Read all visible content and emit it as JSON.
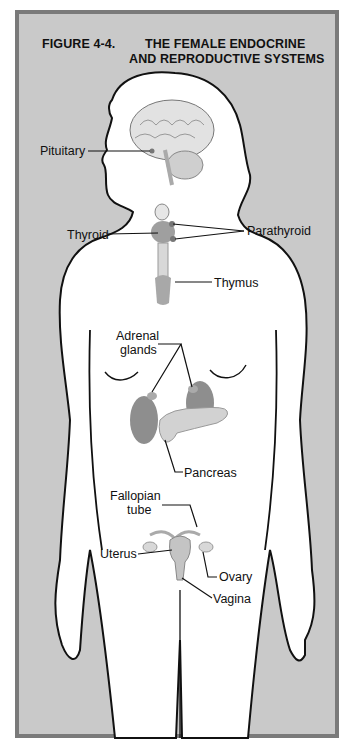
{
  "figure": {
    "number": "FIGURE 4-4.",
    "title_line1": "THE FEMALE ENDOCRINE",
    "title_line2": "AND REPRODUCTIVE SYSTEMS"
  },
  "labels": {
    "pituitary": "Pituitary",
    "thyroid": "Thyroid",
    "parathyroid": "Parathyroid",
    "thymus": "Thymus",
    "adrenal_line1": "Adrenal",
    "adrenal_line2": "glands",
    "pancreas": "Pancreas",
    "fallopian_line1": "Fallopian",
    "fallopian_line2": "tube",
    "uterus": "Uterus",
    "ovary": "Ovary",
    "vagina": "Vagina"
  },
  "colors": {
    "background": "#c9c9c9",
    "border": "#7a7a7a",
    "silhouette": "#ffffff",
    "organ": "#9a9a9a",
    "organ_light": "#cfcfcf"
  }
}
